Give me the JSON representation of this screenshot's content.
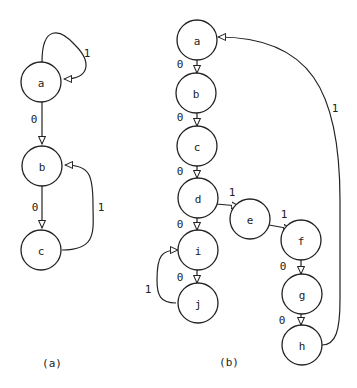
{
  "diagram_a": {
    "caption": "(a)",
    "nodes": [
      {
        "id": "a",
        "label": "a",
        "x": 41,
        "y": 82
      },
      {
        "id": "b",
        "label": "b",
        "x": 42,
        "y": 166
      },
      {
        "id": "c",
        "label": "c",
        "x": 41,
        "y": 250
      }
    ],
    "edges": [
      {
        "from": "a",
        "to": "a",
        "label": "1"
      },
      {
        "from": "a",
        "to": "b",
        "label": "0"
      },
      {
        "from": "b",
        "to": "c",
        "label": "0"
      },
      {
        "from": "c",
        "to": "b",
        "label": "1"
      }
    ]
  },
  "diagram_b": {
    "caption": "(b)",
    "nodes": [
      {
        "id": "a",
        "label": "a",
        "x": 197,
        "y": 40
      },
      {
        "id": "b",
        "label": "b",
        "x": 196,
        "y": 93
      },
      {
        "id": "c",
        "label": "c",
        "x": 197,
        "y": 146
      },
      {
        "id": "d",
        "label": "d",
        "x": 198,
        "y": 198
      },
      {
        "id": "e",
        "label": "e",
        "x": 250,
        "y": 219
      },
      {
        "id": "f",
        "label": "f",
        "x": 301,
        "y": 240
      },
      {
        "id": "g",
        "label": "g",
        "x": 302,
        "y": 294
      },
      {
        "id": "h",
        "label": "h",
        "x": 302,
        "y": 345
      },
      {
        "id": "i",
        "label": "i",
        "x": 198,
        "y": 250
      },
      {
        "id": "j",
        "label": "j",
        "x": 198,
        "y": 303
      }
    ],
    "edges": [
      {
        "from": "a",
        "to": "b",
        "label": "0"
      },
      {
        "from": "b",
        "to": "c",
        "label": "0"
      },
      {
        "from": "c",
        "to": "d",
        "label": "0"
      },
      {
        "from": "d",
        "to": "e",
        "label": "1"
      },
      {
        "from": "e",
        "to": "f",
        "label": "1"
      },
      {
        "from": "f",
        "to": "g",
        "label": "0"
      },
      {
        "from": "g",
        "to": "h",
        "label": "0"
      },
      {
        "from": "h",
        "to": "a",
        "label": "1"
      },
      {
        "from": "d",
        "to": "i",
        "label": "0"
      },
      {
        "from": "i",
        "to": "j",
        "label": "0"
      },
      {
        "from": "j",
        "to": "i",
        "label": "1"
      }
    ]
  }
}
